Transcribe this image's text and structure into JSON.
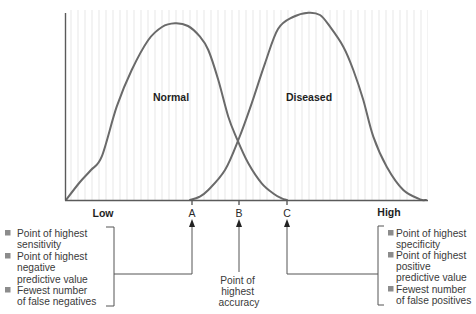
{
  "colors": {
    "curve": "#6a6a6a",
    "axis": "#5a5a5a",
    "bullet": "#8c8c8c",
    "text": "#2a2a2a"
  },
  "axis": {
    "low_label": "Low",
    "high_label": "High"
  },
  "points": {
    "a": "A",
    "b": "B",
    "c": "C"
  },
  "curve_labels": {
    "normal": "Normal",
    "diseased": "Diseased"
  },
  "left_annotation": {
    "items": [
      {
        "lines": [
          "Point of highest",
          "sensitivity"
        ]
      },
      {
        "lines": [
          "Point of highest",
          "negative",
          "predictive value"
        ]
      },
      {
        "lines": [
          "Fewest number",
          "of false negatives"
        ]
      }
    ]
  },
  "middle_annotation": {
    "lines": [
      "Point of",
      "highest",
      "accuracy"
    ]
  },
  "right_annotation": {
    "items": [
      {
        "lines": [
          "Point of highest",
          "specificity"
        ]
      },
      {
        "lines": [
          "Point of highest",
          "positive",
          "predictive value"
        ]
      },
      {
        "lines": [
          "Fewest number",
          "of false positives"
        ]
      }
    ]
  },
  "chart_data": {
    "type": "line",
    "title": "",
    "xlabel": "",
    "ylabel": "",
    "x_tick_labels": [
      "Low",
      "A",
      "B",
      "C",
      "High"
    ],
    "grid": false,
    "legend": "inline labels",
    "series": [
      {
        "name": "Normal",
        "pixel_points": [
          [
            66,
            200
          ],
          [
            80,
            182
          ],
          [
            91,
            170
          ],
          [
            101.7,
            156.7
          ],
          [
            116.7,
            106.7
          ],
          [
            131.7,
            70
          ],
          [
            148.3,
            40
          ],
          [
            162,
            27
          ],
          [
            175,
            23.3
          ],
          [
            188,
            26
          ],
          [
            200,
            36.7
          ],
          [
            208.3,
            50
          ],
          [
            218.3,
            80
          ],
          [
            228.3,
            116.7
          ],
          [
            236.7,
            138.3
          ],
          [
            248.3,
            163.3
          ],
          [
            261.7,
            183.3
          ],
          [
            274,
            194
          ],
          [
            281.7,
            198.3
          ],
          [
            287,
            200
          ]
        ]
      },
      {
        "name": "Diseased",
        "pixel_points": [
          [
            190,
            200
          ],
          [
            199,
            197
          ],
          [
            208.3,
            190
          ],
          [
            225,
            170
          ],
          [
            238.3,
            140
          ],
          [
            251.7,
            103.3
          ],
          [
            265,
            63.3
          ],
          [
            278,
            29
          ],
          [
            293,
            17
          ],
          [
            308.3,
            12.7
          ],
          [
            320,
            15
          ],
          [
            330,
            26.7
          ],
          [
            343.3,
            46.7
          ],
          [
            353.3,
            70
          ],
          [
            363.3,
            100
          ],
          [
            373.3,
            136.7
          ],
          [
            386.7,
            166.7
          ],
          [
            403.3,
            190
          ],
          [
            420,
            199.3
          ],
          [
            426,
            200
          ]
        ]
      }
    ],
    "markers": [
      {
        "label": "A",
        "x_px": 192,
        "meaning": "Point of highest sensitivity / negative predictive value; fewest false negatives"
      },
      {
        "label": "B",
        "x_px": 239,
        "meaning": "Point of highest accuracy"
      },
      {
        "label": "C",
        "x_px": 287,
        "meaning": "Point of highest specificity / positive predictive value; fewest false positives"
      }
    ]
  }
}
